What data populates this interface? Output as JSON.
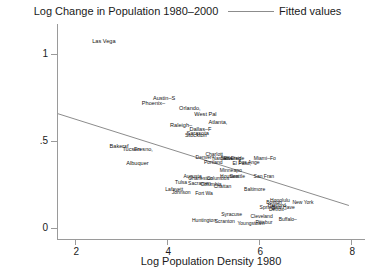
{
  "chart_data": {
    "type": "scatter",
    "title": "Log Change in Population 1980–2000",
    "xlabel": "Log Population Density 1980",
    "ylabel": "",
    "xlim": [
      1.6,
      8.3
    ],
    "ylim": [
      -0.07,
      1.17
    ],
    "xticks": [
      2,
      4,
      6,
      8
    ],
    "xtick_labels": [
      "2",
      "4",
      "6",
      "8"
    ],
    "yticks": [
      0,
      0.5,
      1
    ],
    "ytick_labels": [
      "0",
      ".5",
      "1"
    ],
    "grid": false,
    "marker_style": "text-label",
    "legend": {
      "position": "top-right",
      "entries": [
        {
          "label": "Fitted values",
          "type": "line",
          "color": "#8c8c8c"
        }
      ]
    },
    "series": [
      {
        "name": "Fitted values",
        "type": "line",
        "color": "#8c8c8c",
        "x": [
          1.62,
          7.95
        ],
        "y": [
          0.655,
          0.128
        ]
      },
      {
        "name": "Metro areas",
        "type": "scatter",
        "labels": [
          "Las Vega",
          "Austin–S",
          "Phoenix–",
          "Orlando,",
          "West Pal",
          "Atlanta,",
          "Raleigh–",
          "Dallas–F",
          "Sarasota",
          "Stockton",
          "Bakersf",
          "Tucson",
          "Fresno,",
          "Albuquer",
          "Charlott",
          "Denver–",
          "Riverside",
          "San Dieg",
          "Nashville",
          "Miami–Fo",
          "Portland",
          "Los Ange",
          "El Paso,",
          "Minneapo",
          "Augusta",
          "Charleston",
          "Columbus",
          "Tulsa",
          "Houston",
          "Seattle",
          "San Fran",
          "Sacramen",
          "Lafayett",
          "Johnson",
          "Fort Wa",
          "Columbia",
          "Chattan",
          "Baltimore",
          "Boston",
          "Honolulu",
          "New York",
          "Hartford",
          "New Have",
          "Springf",
          "Detroit–",
          "Syracuse",
          "Huntington",
          "Scranton",
          "Cleveland",
          "Youngstown",
          "Pittsbur",
          "Buffalo–"
        ],
        "x": [
          2.62,
          3.93,
          3.7,
          4.49,
          4.83,
          5.1,
          4.3,
          4.72,
          4.66,
          4.62,
          2.95,
          3.22,
          3.48,
          3.35,
          5.02,
          4.82,
          5.45,
          5.38,
          5.2,
          6.12,
          5.0,
          5.78,
          5.62,
          5.38,
          4.55,
          4.72,
          5.1,
          4.3,
          5.35,
          5.52,
          6.1,
          4.7,
          4.15,
          4.3,
          4.8,
          4.95,
          5.2,
          5.9,
          6.32,
          6.45,
          6.95,
          6.38,
          6.52,
          6.18,
          6.4,
          5.4,
          4.8,
          5.25,
          6.05,
          5.82,
          6.1,
          6.62
        ],
        "y": [
          1.07,
          0.745,
          0.715,
          0.685,
          0.655,
          0.605,
          0.588,
          0.565,
          0.545,
          0.535,
          0.468,
          0.455,
          0.452,
          0.372,
          0.425,
          0.408,
          0.402,
          0.4,
          0.402,
          0.398,
          0.378,
          0.38,
          0.372,
          0.33,
          0.3,
          0.288,
          0.285,
          0.262,
          0.3,
          0.298,
          0.3,
          0.258,
          0.222,
          0.208,
          0.198,
          0.252,
          0.238,
          0.225,
          0.15,
          0.162,
          0.148,
          0.132,
          0.122,
          0.118,
          0.108,
          0.082,
          0.042,
          0.04,
          0.068,
          0.028,
          0.032,
          0.048
        ]
      }
    ]
  }
}
